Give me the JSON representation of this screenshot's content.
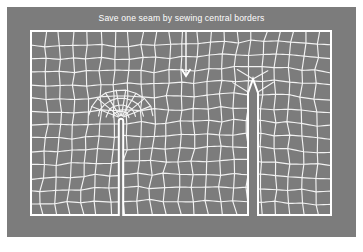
{
  "figure": {
    "caption": "Save one seam by sewing central borders",
    "background_color": "#ffffff",
    "panel_color": "#7c7c7c",
    "line_color": "#f2f2f2",
    "caption_color": "#ffffff"
  },
  "panel": {
    "x": 7,
    "y": 7,
    "width": 349,
    "height": 230
  },
  "mesh": {
    "x": 31,
    "y": 31,
    "width": 300,
    "height": 184,
    "columns": 22,
    "rows": 14,
    "description": "quadrilateral finite-element mesh of a rectangular sheet"
  },
  "slits": [
    {
      "name": "left-slit",
      "label": "rounded-tip seam",
      "center_x": 121,
      "tip_y": 118,
      "bottom_y": 215,
      "half_width": 2.2,
      "tip_shape": "rounded",
      "refinement": "radial-fan"
    },
    {
      "name": "right-slit",
      "label": "pointed-tip seam",
      "center_x": 253,
      "tip_y": 79,
      "bottom_y": 215,
      "half_width": 5.0,
      "tip_shape": "pointed",
      "refinement": "none"
    }
  ],
  "annotation": {
    "arrow": {
      "name": "down-arrow",
      "x": 186,
      "y_start": 30,
      "y_end": 76,
      "direction": "down",
      "head_width": 9,
      "head_height": 7
    }
  },
  "chart_data": {
    "type": "diagram",
    "title": "Save one seam by sewing central borders",
    "xlabel": "",
    "ylabel": "",
    "annotations": [
      "down-arrow pointing from caption toward the mesh interior"
    ],
    "elements": [
      "quad-mesh",
      "left-slit",
      "right-slit",
      "mesh-outline"
    ]
  }
}
